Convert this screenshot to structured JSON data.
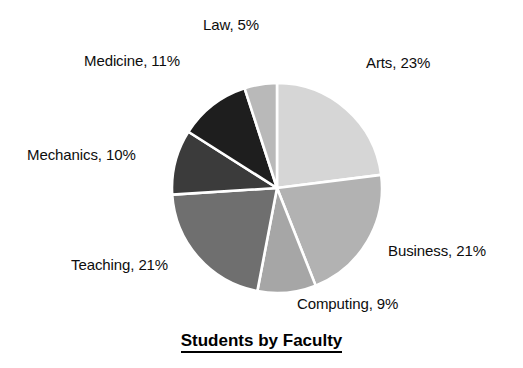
{
  "chart_data": {
    "type": "pie",
    "title": "Students by Faculty",
    "xlabel": "",
    "ylabel": "",
    "legend": "none",
    "grid": false,
    "units": "percent",
    "start_angle_deg": 0,
    "direction": "clockwise",
    "categories": [
      "Arts",
      "Business",
      "Computing",
      "Teaching",
      "Mechanics",
      "Medicine",
      "Law"
    ],
    "values": [
      23,
      21,
      9,
      21,
      10,
      11,
      5
    ],
    "total": 100,
    "slices": [
      {
        "label": "Arts",
        "value": 23,
        "text": "Arts, 23%",
        "color": "#d6d6d6"
      },
      {
        "label": "Business",
        "value": 21,
        "text": "Business, 21%",
        "color": "#b2b2b2"
      },
      {
        "label": "Computing",
        "value": 9,
        "text": "Computing, 9%",
        "color": "#a6a6a6"
      },
      {
        "label": "Teaching",
        "value": 21,
        "text": "Teaching, 21%",
        "color": "#6f6f6f"
      },
      {
        "label": "Mechanics",
        "value": 10,
        "text": "Mechanics, 10%",
        "color": "#3b3b3b"
      },
      {
        "label": "Medicine",
        "value": 11,
        "text": "Medicine, 11%",
        "color": "#1e1e1e"
      },
      {
        "label": "Law",
        "value": 5,
        "text": "Law, 5%",
        "color": "#b9b9b9"
      }
    ],
    "separator_color": "#ffffff",
    "background_color": "#ffffff",
    "text_color": "#0d0d0d"
  },
  "labels": {
    "arts": "Arts, 23%",
    "business": "Business, 21%",
    "computing": "Computing, 9%",
    "teaching": "Teaching, 21%",
    "mechanics": "Mechanics, 10%",
    "medicine": "Medicine, 11%",
    "law": "Law, 5%"
  },
  "title": "Students by Faculty"
}
